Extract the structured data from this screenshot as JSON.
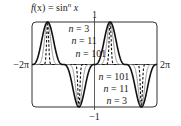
{
  "chart_data": {
    "type": "line",
    "title_parts": {
      "f": "f",
      "x_paren": "(x)",
      "eq": " = sin",
      "sup": "n",
      "x": " x"
    },
    "xlabel": "",
    "ylabel": "",
    "xlim": [
      -6.2832,
      6.2832
    ],
    "ylim": [
      -1,
      1
    ],
    "x_tick_labels": {
      "left": "−2π",
      "right": "2π"
    },
    "y_tick_labels": {
      "top": "1",
      "bottom": "−1"
    },
    "grid": false,
    "function": "sin(x)^n",
    "series": [
      {
        "name": "n = 3",
        "n": 3,
        "style": "solid",
        "color": "#111111",
        "width": 1.6
      },
      {
        "name": "n = 11",
        "n": 11,
        "style": "solid",
        "color": "#9a9a9a",
        "width": 1.0
      },
      {
        "name": "n = 101",
        "n": 101,
        "style": "dashed",
        "color": "#111111",
        "width": 1.1
      }
    ],
    "annotations": [
      {
        "text": "n = 3",
        "n_text": "n",
        "rest": " = 3",
        "x": -2.6,
        "y": 0.83
      },
      {
        "text": "n = 11",
        "n_text": "n",
        "rest": " = 11",
        "x": -2.3,
        "y": 0.55
      },
      {
        "text": "n = 101",
        "n_text": "n",
        "rest": " = 101",
        "x": -1.9,
        "y": 0.25
      },
      {
        "text": "n = 101",
        "n_text": "n",
        "rest": " = 101",
        "x": 0.4,
        "y": -0.3
      },
      {
        "text": "n = 11",
        "n_text": "n",
        "rest": " = 11",
        "x": 0.9,
        "y": -0.58
      },
      {
        "text": "n = 3",
        "n_text": "n",
        "rest": " = 3",
        "x": 1.2,
        "y": -0.86
      }
    ]
  }
}
